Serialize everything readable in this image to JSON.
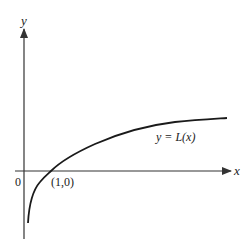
{
  "diagram": {
    "type": "function-graph",
    "function_label": "y = L(x)",
    "axes": {
      "x_label": "x",
      "y_label": "y",
      "origin_label": "0"
    },
    "points": [
      {
        "label": "(1,0)",
        "x": 1,
        "y": 0
      }
    ],
    "curve_description": "Logarithmic curve: rises steeply from below near the y-axis, crosses x-axis at (1,0), then flattens gradually to the right",
    "colors": {
      "axis": "#333333",
      "curve": "#1a1a1a",
      "background": "#ffffff"
    }
  }
}
